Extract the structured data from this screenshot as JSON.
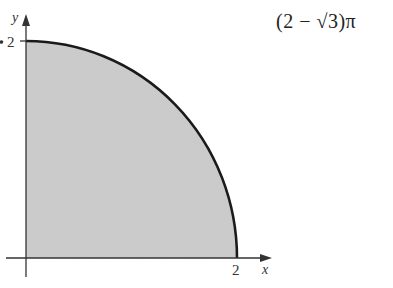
{
  "figure": {
    "x_axis_label": "x",
    "y_axis_label": "y",
    "x_tick_label": "2",
    "y_tick_label": "2",
    "region": "quarter disk of radius 2 in first quadrant",
    "fill_color": "#c8c8c8",
    "stroke_color": "#1a1a1a"
  },
  "answer": {
    "expression": "(2 − √3)π"
  }
}
